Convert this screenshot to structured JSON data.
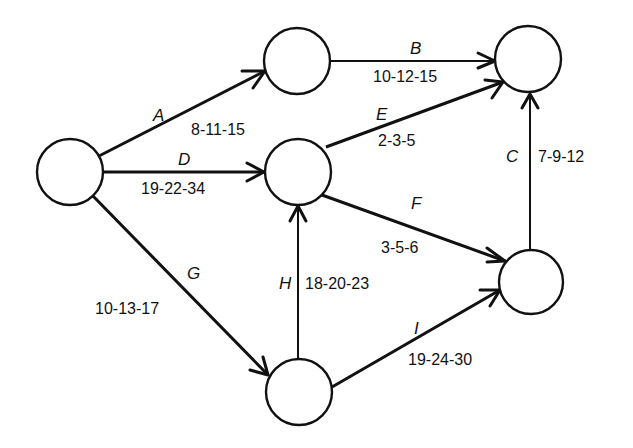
{
  "diagram": {
    "type": "activity-on-arrow network",
    "nodes": [
      {
        "id": "n1",
        "cx": 70,
        "cy": 172,
        "r": 33
      },
      {
        "id": "n2",
        "cx": 297,
        "cy": 61,
        "r": 33
      },
      {
        "id": "n3",
        "cx": 298,
        "cy": 172,
        "r": 33
      },
      {
        "id": "n4",
        "cx": 528,
        "cy": 59,
        "r": 33
      },
      {
        "id": "n5",
        "cx": 531,
        "cy": 282,
        "r": 32
      },
      {
        "id": "n6",
        "cx": 299,
        "cy": 392,
        "r": 33
      }
    ],
    "edges": [
      {
        "activity": "A",
        "from": "n1",
        "to": "n2",
        "estimates": "8-11-15"
      },
      {
        "activity": "B",
        "from": "n2",
        "to": "n4",
        "estimates": "10-12-15"
      },
      {
        "activity": "C",
        "from": "n5",
        "to": "n4",
        "estimates": "7-9-12"
      },
      {
        "activity": "D",
        "from": "n1",
        "to": "n3",
        "estimates": "19-22-34"
      },
      {
        "activity": "E",
        "from": "n3",
        "to": "n4",
        "estimates": "2-3-5"
      },
      {
        "activity": "F",
        "from": "n3",
        "to": "n5",
        "estimates": "3-5-6"
      },
      {
        "activity": "G",
        "from": "n1",
        "to": "n6",
        "estimates": "10-13-17"
      },
      {
        "activity": "H",
        "from": "n6",
        "to": "n3",
        "estimates": "18-20-23"
      },
      {
        "activity": "I",
        "from": "n6",
        "to": "n5",
        "estimates": "19-24-30"
      }
    ]
  },
  "labels": {
    "A": {
      "letter": "A",
      "dur": "8-11-15"
    },
    "B": {
      "letter": "B",
      "dur": "10-12-15"
    },
    "C": {
      "letter": "C",
      "dur": "7-9-12"
    },
    "D": {
      "letter": "D",
      "dur": "19-22-34"
    },
    "E": {
      "letter": "E",
      "dur": "2-3-5"
    },
    "F": {
      "letter": "F",
      "dur": "3-5-6"
    },
    "G": {
      "letter": "G",
      "dur": "10-13-17"
    },
    "H": {
      "letter": "H",
      "dur": "18-20-23"
    },
    "I": {
      "letter": "I",
      "dur": "19-24-30"
    }
  },
  "colors": {
    "line": "#111111",
    "background": "#ffffff"
  }
}
